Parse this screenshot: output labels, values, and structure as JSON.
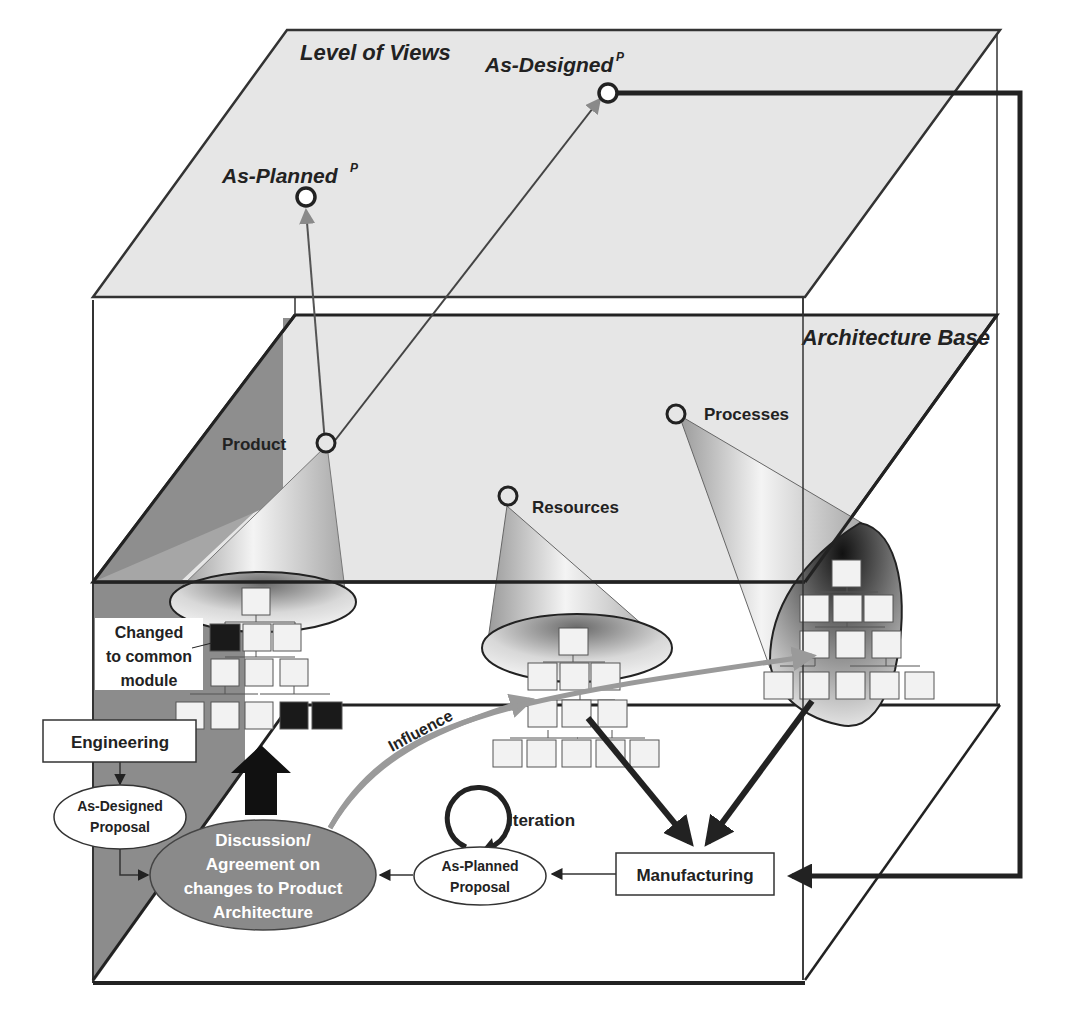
{
  "layers": {
    "top": {
      "title": "Level of Views"
    },
    "middle": {
      "title": "Architecture Base"
    }
  },
  "views": {
    "as_planned": {
      "label": "As-Planned",
      "sup": "P"
    },
    "as_designed": {
      "label": "As-Designed",
      "sup": "P"
    }
  },
  "nodes": {
    "product": "Product",
    "resources": "Resources",
    "processes": "Processes"
  },
  "annotations": {
    "changed_line1": "Changed",
    "changed_line2": "to common",
    "changed_line3": "module",
    "influence": "Influence",
    "iteration": "Iteration"
  },
  "boxes": {
    "engineering": "Engineering",
    "manufacturing": "Manufacturing"
  },
  "ellipses": {
    "as_designed_proposal_line1": "As-Designed",
    "as_designed_proposal_line2": "Proposal",
    "as_planned_proposal_line1": "As-Planned",
    "as_planned_proposal_line2": "Proposal",
    "discussion_line1": "Discussion/",
    "discussion_line2": "Agreement on",
    "discussion_line3": "changes to Product",
    "discussion_line4": "Architecture"
  },
  "colors": {
    "plane_fill": "#e8e8e8",
    "dark_wall": "#8c8c8c",
    "discussion_fill": "#8a8a8a",
    "highlight_module": "#1a1a1a",
    "influence_arrow": "#9a9a9a",
    "line": "#222222"
  }
}
